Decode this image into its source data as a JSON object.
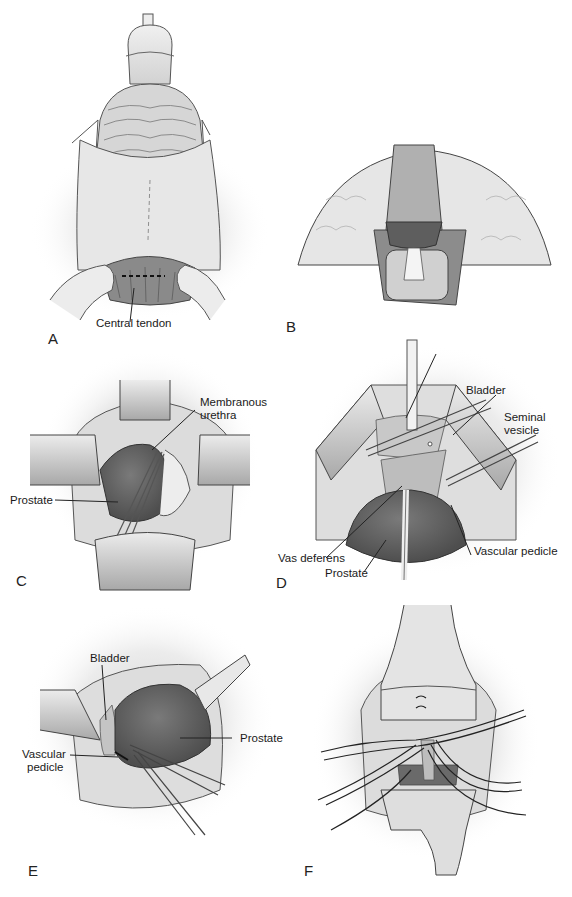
{
  "figure": {
    "palette": {
      "ink": "#3a3a3a",
      "tissue_light": "#e4e4e4",
      "tissue_mid": "#b8b8b8",
      "tissue_dark": "#6e6e6e",
      "background": "#ffffff"
    }
  },
  "panels": [
    {
      "id": "A",
      "letter": "A",
      "labels": [
        {
          "text": "Central tendon"
        }
      ]
    },
    {
      "id": "B",
      "letter": "B",
      "labels": []
    },
    {
      "id": "C",
      "letter": "C",
      "labels": [
        {
          "text": "Membranous"
        },
        {
          "text": "urethra"
        },
        {
          "text": "Prostate"
        }
      ]
    },
    {
      "id": "D",
      "letter": "D",
      "labels": [
        {
          "text": "Bladder"
        },
        {
          "text": "Seminal"
        },
        {
          "text": "vesicle"
        },
        {
          "text": "Vas deferens"
        },
        {
          "text": "Prostate"
        },
        {
          "text": "Vascular pedicle"
        }
      ]
    },
    {
      "id": "E",
      "letter": "E",
      "labels": [
        {
          "text": "Bladder"
        },
        {
          "text": "Vascular"
        },
        {
          "text": "pedicle"
        },
        {
          "text": "Prostate"
        }
      ]
    },
    {
      "id": "F",
      "letter": "F",
      "labels": []
    }
  ]
}
